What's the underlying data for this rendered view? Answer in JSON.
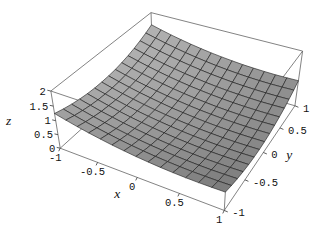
{
  "figure": {
    "background": "#ffffff"
  },
  "chart_data": {
    "type": "surface3d",
    "title": "",
    "xlabel": "x",
    "ylabel": "y",
    "zlabel": "z",
    "x_range": [
      -1,
      1
    ],
    "y_range": [
      -1,
      1
    ],
    "z_range": [
      0,
      2
    ],
    "x_ticks": {
      "values": [
        -1,
        -0.5,
        0,
        0.5,
        1
      ],
      "labels": [
        "-1",
        "-0.5",
        "0",
        "0.5",
        "1"
      ]
    },
    "y_ticks": {
      "values": [
        -1,
        -0.5,
        0,
        0.5,
        1
      ],
      "labels": [
        "-1",
        "-0.5",
        "0",
        "0.5",
        "1"
      ]
    },
    "z_ticks": {
      "values": [
        0,
        0.5,
        1,
        1.5,
        2
      ],
      "labels": [
        "0",
        "0.5",
        "1",
        "1.5",
        "2"
      ]
    },
    "mesh": {
      "nx": 14,
      "ny": 14
    },
    "surface": {
      "model": "quadratic",
      "formula": "z = 0.5 - 0.3x + 0.15y + 0.2x^2 + 0.4y^2",
      "coefficients": {
        "const": 0.5,
        "x": -0.3,
        "y": 0.15,
        "x2": 0.2,
        "y2": 0.4
      },
      "corner_values": {
        "z(-1,-1)": 1.25,
        "z(1,-1)": 0.65,
        "z(1,1)": 0.95,
        "z(-1,1)": 1.55
      }
    },
    "view": {
      "projection": "perspective",
      "camera": [
        2.6,
        -4.8,
        4.0
      ],
      "box_aspect": [
        1,
        1,
        0.4
      ]
    },
    "style": {
      "background": "#ffffff",
      "mesh_line_color": "#1b1b1b",
      "box_edge_color": "#5a5a5a",
      "tick_mark_color": "#333333",
      "text_color": "#111111",
      "light_dir": [
        0.9,
        -0.25,
        0.35
      ],
      "ambient": 0.35,
      "diffuse": 0.55,
      "grid_on": true,
      "legend": "none"
    }
  }
}
